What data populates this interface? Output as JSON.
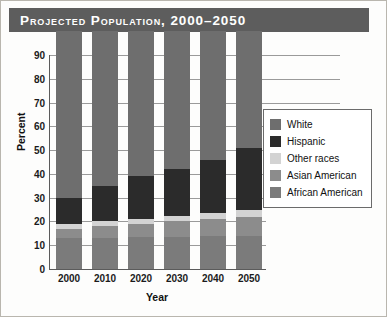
{
  "title": "Projected Population, 2000–2050",
  "theme": {
    "banner_bg": "#5d5d5d",
    "banner_text": "#ffffff",
    "page_bg": "#fdfdfc",
    "axis": "#5b5b5b",
    "grid": "#9a9a9a"
  },
  "chart_data": {
    "type": "bar",
    "subtype": "stacked-bar",
    "title": "Projected Population, 2000–2050",
    "xlabel": "Year",
    "ylabel": "Percent",
    "categories": [
      "2000",
      "2010",
      "2020",
      "2030",
      "2040",
      "2050"
    ],
    "ylim": [
      0,
      90
    ],
    "ytick_step": 10,
    "yticks": [
      "0",
      "10",
      "20",
      "30",
      "40",
      "50",
      "60",
      "70",
      "80",
      "90"
    ],
    "grid": true,
    "grid_axis": "y",
    "legend_position": "right-inside",
    "stack_order_bottom_to_top": [
      "African American",
      "Asian American",
      "Other races",
      "Hispanic",
      "White"
    ],
    "series": [
      {
        "name": "African American",
        "color": "#7b7b7b",
        "values": [
          13.0,
          13.2,
          13.4,
          13.6,
          13.8,
          14.0
        ]
      },
      {
        "name": "Asian American",
        "color": "#8c8c8c",
        "values": [
          4.0,
          4.8,
          5.6,
          6.4,
          7.2,
          8.0
        ]
      },
      {
        "name": "Other races",
        "color": "#d3d3d3",
        "values": [
          1.8,
          2.0,
          2.2,
          2.4,
          2.6,
          2.8
        ]
      },
      {
        "name": "Hispanic",
        "color": "#2b2b2b",
        "values": [
          11.2,
          15.0,
          17.8,
          19.6,
          22.4,
          26.2
        ]
      },
      {
        "name": "White",
        "color": "#6e6e6e",
        "values": [
          70.0,
          65.0,
          61.0,
          58.0,
          54.0,
          49.0
        ]
      }
    ],
    "legend_entries": [
      {
        "label": "White",
        "color": "#6e6e6e"
      },
      {
        "label": "Hispanic",
        "color": "#2b2b2b"
      },
      {
        "label": "Other races",
        "color": "#d3d3d3"
      },
      {
        "label": "Asian American",
        "color": "#8c8c8c"
      },
      {
        "label": "African American",
        "color": "#7b7b7b"
      }
    ]
  }
}
